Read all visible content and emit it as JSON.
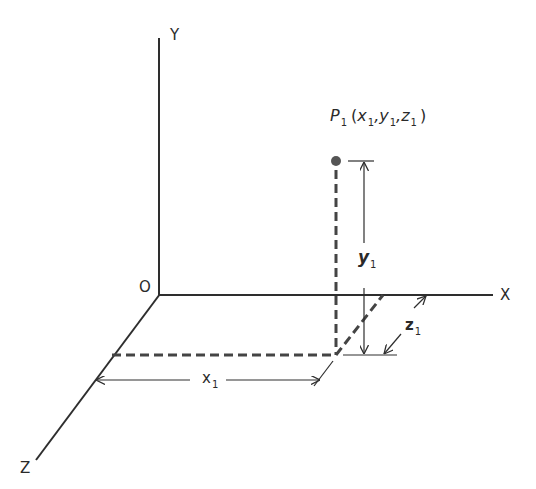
{
  "diagram": {
    "type": "3d-coordinate-system",
    "colors": {
      "line": "#2e2e2e",
      "dashed": "#444444",
      "point": "#555555",
      "background": "#ffffff"
    },
    "axes": {
      "origin_label": "O",
      "x_label": "X",
      "y_label": "Y",
      "z_label": "Z"
    },
    "point": {
      "name": "P",
      "name_sub": "1",
      "open": "(",
      "x": "x",
      "x_sub": "1",
      "sep1": ",",
      "y": "y",
      "y_sub": "1",
      "sep2": ",",
      "z": "z",
      "z_sub": "1",
      "close": ")"
    },
    "dimensions": {
      "x1": {
        "label": "x",
        "sub": "1"
      },
      "y1": {
        "label": "y",
        "sub": "1"
      },
      "z1": {
        "label": "z",
        "sub": "1"
      }
    }
  }
}
